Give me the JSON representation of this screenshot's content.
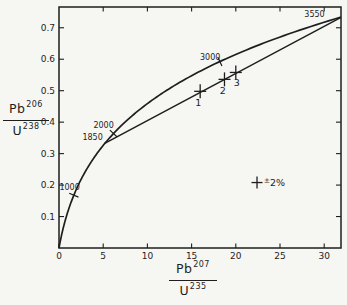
{
  "figure": {
    "background": "#f6f6f2",
    "ink": "#1e1e1e"
  },
  "chart_data": {
    "type": "line",
    "title": "",
    "xlabel": "Pb207/U235",
    "ylabel": "Pb206/U238",
    "xlabel_fraction": {
      "num": "Pb",
      "num_sup": "207",
      "den": "U",
      "den_sup": "235"
    },
    "ylabel_fraction": {
      "num": "Pb",
      "num_sup": "206",
      "den": "U",
      "den_sup": "238"
    },
    "xlim": [
      0,
      31.9
    ],
    "ylim": [
      0,
      0.766
    ],
    "x_ticks": [
      0,
      5,
      10,
      15,
      20,
      25,
      30
    ],
    "y_ticks": [
      0.1,
      0.2,
      0.3,
      0.4,
      0.5,
      0.6,
      0.7
    ],
    "grid": false,
    "series": [
      {
        "name": "concordia",
        "type": "curve",
        "decay": {
          "lambda235_perGa": 0.98485,
          "lambda238_perGa": 0.155125,
          "t_start_Ga": 0,
          "t_end_Ga": 3.547
        },
        "points": [
          [
            0,
            0
          ],
          [
            0.218,
            0.0315
          ],
          [
            0.483,
            0.064
          ],
          [
            0.806,
            0.0975
          ],
          [
            1.199,
            0.1321
          ],
          [
            1.677,
            0.1678
          ],
          [
            2.26,
            0.2046
          ],
          [
            2.97,
            0.2426
          ],
          [
            3.834,
            0.2818
          ],
          [
            5.184,
            0.3324
          ],
          [
            6.168,
            0.3638
          ],
          [
            7.728,
            0.4067
          ],
          [
            9.629,
            0.4511
          ],
          [
            11.944,
            0.4968
          ],
          [
            14.761,
            0.544
          ],
          [
            18.194,
            0.5926
          ],
          [
            22.375,
            0.6428
          ],
          [
            27.462,
            0.6946
          ],
          [
            31.9,
            0.7337
          ]
        ]
      },
      {
        "name": "discordia",
        "type": "line",
        "points": [
          [
            5.171,
            0.3323
          ],
          [
            31.9,
            0.7332
          ]
        ]
      }
    ],
    "age_marks": [
      {
        "label": "1000",
        "x": 1.677,
        "y": 0.1678,
        "tick": true,
        "lx": 0.05,
        "ly": 0.193,
        "anchor": "start"
      },
      {
        "label": "1850",
        "x": 5.184,
        "y": 0.3324,
        "tick": false,
        "lx": 4.95,
        "ly": 0.352,
        "anchor": "end"
      },
      {
        "label": "2000",
        "x": 6.168,
        "y": 0.3638,
        "tick": true,
        "lx": 6.2,
        "ly": 0.392,
        "anchor": "end"
      },
      {
        "label": "3000",
        "x": 18.194,
        "y": 0.5926,
        "tick": true,
        "lx": 17.1,
        "ly": 0.608,
        "anchor": "middle"
      },
      {
        "label": "3550",
        "x": 31.5,
        "y": 0.728,
        "tick": false,
        "lx": 28.9,
        "ly": 0.744,
        "anchor": "middle"
      }
    ],
    "samples": [
      {
        "label": "1",
        "x": 15.97,
        "y": 0.498,
        "label_dx": -2,
        "label_dy": 15
      },
      {
        "label": "2",
        "x": 18.72,
        "y": 0.536,
        "label_dx": -1.6,
        "label_dy": 14.5
      },
      {
        "label": "3",
        "x": 20.0,
        "y": 0.558,
        "label_dx": 1,
        "label_dy": 13.5
      }
    ],
    "error_legend": {
      "symbol": "cross",
      "text": "±2%",
      "x": 22.4,
      "y": 0.208,
      "text_x": 23.15
    }
  }
}
